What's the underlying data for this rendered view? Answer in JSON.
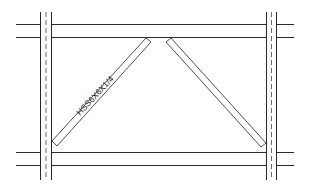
{
  "diagram": {
    "type": "braced-frame-elevation",
    "colors": {
      "line": "#2a2a2a",
      "brace": "#3a3a3a",
      "background": "#ffffff"
    },
    "beams": [
      {
        "name": "top-beam",
        "x1": 16,
        "x2": 294,
        "y_top": 24,
        "y_bottom": 37
      },
      {
        "name": "bottom-beam",
        "x1": 16,
        "x2": 294,
        "y_top": 152,
        "y_bottom": 165
      }
    ],
    "columns": [
      {
        "name": "left-column",
        "x_left": 40,
        "x_right": 52,
        "x_center": 46,
        "y1": 12,
        "y2": 180
      },
      {
        "name": "right-column",
        "x_left": 266,
        "x_right": 277,
        "x_center": 272,
        "y1": 12,
        "y2": 180
      }
    ],
    "braces": [
      {
        "name": "left-brace",
        "label": "HSS6X6X1/4"
      },
      {
        "name": "right-brace",
        "label": ""
      }
    ],
    "brace_label": "HSS6X6X1/4"
  }
}
